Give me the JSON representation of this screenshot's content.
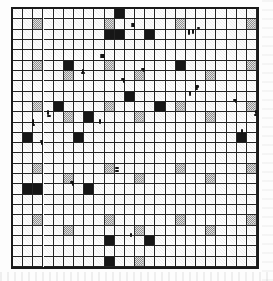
{
  "document": {
    "type": "scanned-grid-worksheet",
    "title_text": "",
    "caption_text": "",
    "background_color": "#fdfdfd",
    "ink_color": "#161616",
    "gray_fill_color": "#b9b9b9",
    "grid_line_color": "#232323",
    "border_color": "#1a1a1a"
  },
  "grid": {
    "name": "cell-grid",
    "columns": 24,
    "rows": 25,
    "cell_width": 10.17,
    "cell_height": 10.32,
    "origin_x": 0,
    "origin_y": 0,
    "border_width": 2,
    "line_width": 1.4
  },
  "chart_data": {
    "type": "heatmap",
    "title": "",
    "xlabel": "",
    "ylabel": "",
    "grid": true,
    "legend": "none",
    "columns": 24,
    "rows": 25,
    "value_legend": {
      "0": "empty",
      "1": "gray (50% dither)",
      "2": "black (filled)"
    },
    "gray_cells": [
      [
        1,
        2
      ],
      [
        1,
        9
      ],
      [
        1,
        16
      ],
      [
        1,
        23
      ],
      [
        5,
        2
      ],
      [
        5,
        9
      ],
      [
        5,
        16
      ],
      [
        5,
        23
      ],
      [
        6,
        5
      ],
      [
        6,
        12
      ],
      [
        6,
        19
      ],
      [
        9,
        2
      ],
      [
        9,
        9
      ],
      [
        9,
        16
      ],
      [
        9,
        23
      ],
      [
        10,
        5
      ],
      [
        10,
        12
      ],
      [
        10,
        19
      ],
      [
        15,
        2
      ],
      [
        15,
        9
      ],
      [
        15,
        16
      ],
      [
        15,
        23
      ],
      [
        16,
        5
      ],
      [
        16,
        12
      ],
      [
        16,
        19
      ],
      [
        20,
        2
      ],
      [
        20,
        9
      ],
      [
        20,
        16
      ],
      [
        20,
        23
      ],
      [
        21,
        5
      ],
      [
        21,
        12
      ],
      [
        21,
        19
      ],
      [
        24,
        12
      ]
    ],
    "black_cells": [
      [
        0,
        10
      ],
      [
        2,
        9
      ],
      [
        2,
        10
      ],
      [
        2,
        13
      ],
      [
        5,
        5
      ],
      [
        5,
        16
      ],
      [
        8,
        11
      ],
      [
        9,
        4
      ],
      [
        9,
        14
      ],
      [
        10,
        7
      ],
      [
        12,
        1
      ],
      [
        12,
        6
      ],
      [
        12,
        22
      ],
      [
        17,
        1
      ],
      [
        17,
        2
      ],
      [
        17,
        7
      ],
      [
        22,
        9
      ],
      [
        22,
        13
      ],
      [
        24,
        9
      ]
    ],
    "marks": [
      {
        "kind": "stroke-down-left",
        "col": 2,
        "row": 10
      },
      {
        "kind": "stroke-up-right",
        "col": 2,
        "row": 13
      },
      {
        "kind": "stroke-down",
        "col": 3,
        "row": 9
      },
      {
        "kind": "stroke-down-right",
        "col": 6,
        "row": 5
      },
      {
        "kind": "stroke-up-right",
        "col": 5,
        "row": 17
      },
      {
        "kind": "stroke-vertical",
        "col": 8,
        "row": 11
      },
      {
        "kind": "stroke-left-dash",
        "col": 9,
        "row": 4
      },
      {
        "kind": "stroke-right-dash",
        "col": 9,
        "row": 15
      },
      {
        "kind": "stroke-up-right",
        "col": 10,
        "row": 7
      },
      {
        "kind": "stroke-up-right",
        "col": 12,
        "row": 6
      },
      {
        "kind": "stroke-left-dash",
        "col": 12,
        "row": 1
      },
      {
        "kind": "stroke-vertical",
        "col": 11,
        "row": 22
      },
      {
        "kind": "stroke-down-legs",
        "col": 17,
        "row": 1
      },
      {
        "kind": "stroke-down-right-legs",
        "col": 17,
        "row": 7
      },
      {
        "kind": "stroke-up-right",
        "col": 21,
        "row": 9
      },
      {
        "kind": "stroke-vertical",
        "col": 22,
        "row": 12
      },
      {
        "kind": "stroke-down-right",
        "col": 23,
        "row": 9
      }
    ]
  }
}
